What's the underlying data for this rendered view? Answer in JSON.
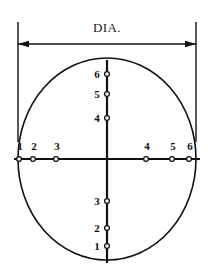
{
  "figure": {
    "dimension": {
      "label": "DIA.",
      "label_x": 107,
      "label_y": 28,
      "arrow_y": 44,
      "arrow_left_x": 18,
      "arrow_right_x": 196,
      "ext_line_top_y": 22,
      "ext_line_bottom_y": 142
    },
    "circle": {
      "center_x": 107,
      "center_y": 159,
      "radius_x": 89,
      "radius_y": 101,
      "stroke": "#111111",
      "stroke_width": 1.6
    },
    "axes": {
      "horizontal": {
        "x1": 14,
        "y1": 159,
        "x2": 200,
        "y2": 159
      },
      "vertical": {
        "x1": 107,
        "y1": 60,
        "x2": 107,
        "y2": 263
      },
      "stroke": "#111111",
      "stroke_width": 2.2
    },
    "marker_style": {
      "radius": 2.4,
      "fill": "#ffffff",
      "stroke": "#111111",
      "stroke_width": 1.3
    },
    "horizontal_points": [
      {
        "label": "1",
        "x": 19,
        "y": 159,
        "label_x": 20,
        "label_y": 146
      },
      {
        "label": "2",
        "x": 33,
        "y": 159,
        "label_x": 34,
        "label_y": 146
      },
      {
        "label": "3",
        "x": 56,
        "y": 159,
        "label_x": 57,
        "label_y": 146
      },
      {
        "label": "4",
        "x": 146,
        "y": 159,
        "label_x": 147,
        "label_y": 146
      },
      {
        "label": "5",
        "x": 172,
        "y": 159,
        "label_x": 173,
        "label_y": 146
      },
      {
        "label": "6",
        "x": 189,
        "y": 159,
        "label_x": 190,
        "label_y": 146
      }
    ],
    "vertical_points": [
      {
        "label": "6",
        "x": 107,
        "y": 74,
        "label_x": 97,
        "label_y": 74
      },
      {
        "label": "5",
        "x": 107,
        "y": 94,
        "label_x": 97,
        "label_y": 94
      },
      {
        "label": "4",
        "x": 107,
        "y": 118,
        "label_x": 97,
        "label_y": 118
      },
      {
        "label": "3",
        "x": 107,
        "y": 201,
        "label_x": 97,
        "label_y": 201
      },
      {
        "label": "2",
        "x": 107,
        "y": 228,
        "label_x": 97,
        "label_y": 228
      },
      {
        "label": "1",
        "x": 107,
        "y": 246,
        "label_x": 97,
        "label_y": 246
      }
    ]
  }
}
